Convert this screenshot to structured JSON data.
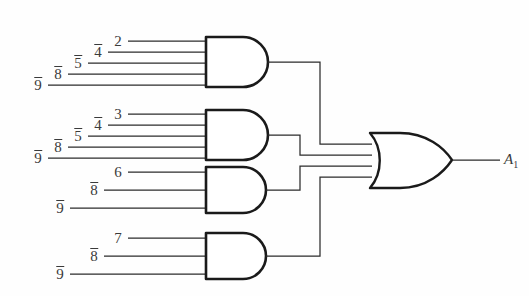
{
  "figure": {
    "background_color": "#fefefe",
    "line_color": "#2b2b2b",
    "gate_stroke_color": "#1a1a1a",
    "label_color": "#3a3a3a"
  },
  "output": {
    "name": "A",
    "subscript": "1",
    "label": "A"
  },
  "gates": [
    {
      "id": "and-gate-1",
      "type": "AND",
      "inputs": [
        {
          "label": "2",
          "overbar": false
        },
        {
          "label": "4",
          "overbar": true
        },
        {
          "label": "5",
          "overbar": true
        },
        {
          "label": "8",
          "overbar": true
        },
        {
          "label": "9",
          "overbar": true
        }
      ]
    },
    {
      "id": "and-gate-2",
      "type": "AND",
      "inputs": [
        {
          "label": "3",
          "overbar": false
        },
        {
          "label": "4",
          "overbar": true
        },
        {
          "label": "5",
          "overbar": true
        },
        {
          "label": "8",
          "overbar": true
        },
        {
          "label": "9",
          "overbar": true
        }
      ]
    },
    {
      "id": "and-gate-3",
      "type": "AND",
      "inputs": [
        {
          "label": "6",
          "overbar": false
        },
        {
          "label": "8",
          "overbar": true
        },
        {
          "label": "9",
          "overbar": true
        }
      ]
    },
    {
      "id": "and-gate-4",
      "type": "AND",
      "inputs": [
        {
          "label": "7",
          "overbar": false
        },
        {
          "label": "8",
          "overbar": true
        },
        {
          "label": "9",
          "overbar": true
        }
      ]
    }
  ],
  "or_gate": {
    "id": "or-gate-1",
    "type": "OR",
    "input_count": 4
  }
}
